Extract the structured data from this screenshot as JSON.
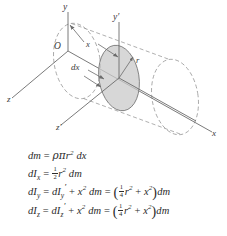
{
  "figure": {
    "colors": {
      "line": "#6b6b6b",
      "dashed": "#9a9a9a",
      "disk_fill": "#c9c9c9",
      "disk_edge": "#7d7d7d",
      "text": "#3a3a3a",
      "background": "#ffffff"
    },
    "axis_labels": {
      "y": "y",
      "y_prime": "y′",
      "z": "z",
      "z_prime": "z′",
      "x": "x",
      "origin": "O"
    },
    "dimension_labels": {
      "x_distance": "x",
      "thickness": "dx",
      "radius": "r"
    }
  },
  "equations": {
    "line1": {
      "lhs": "dm",
      "equals": "=",
      "rhs_density": "ρ",
      "rhs_pi": "π",
      "rhs_r": "r",
      "rhs_r_exp": "2",
      "rhs_dx": "dx"
    },
    "line2": {
      "lhs": "dI",
      "lhs_sub": "x",
      "equals": "=",
      "frac_num": "1",
      "frac_den": "2",
      "r": "r",
      "r_exp": "2",
      "dm": "dm"
    },
    "line3": {
      "lhs": "dI",
      "lhs_sub": "y",
      "equals1": "=",
      "term1": "dI",
      "term1_sub": "y",
      "term1_prime": "′",
      "plus1": "+",
      "x": "x",
      "x_exp": "2",
      "dm1": "dm",
      "equals2": "=",
      "open_paren": "(",
      "frac_num": "1",
      "frac_den": "4",
      "r": "r",
      "r_exp": "2",
      "plus2": "+",
      "x2": "x",
      "x2_exp": "2",
      "close_paren": ")",
      "dm2": "dm"
    },
    "line4": {
      "lhs": "dI",
      "lhs_sub": "z",
      "equals1": "=",
      "term1": "dI",
      "term1_sub": "z",
      "term1_prime": "′",
      "plus1": "+",
      "x": "x",
      "x_exp": "2",
      "dm1": "dm",
      "equals2": "=",
      "open_paren": "(",
      "frac_num": "1",
      "frac_den": "4",
      "r": "r",
      "r_exp": "2",
      "plus2": "+",
      "x2": "x",
      "x2_exp": "2",
      "close_paren": ")",
      "dm2": "dm"
    }
  }
}
